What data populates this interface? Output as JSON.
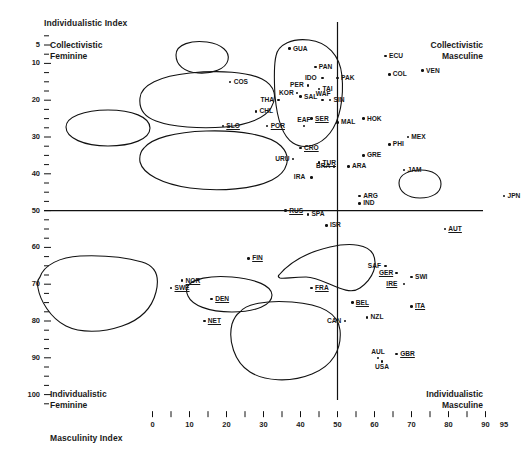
{
  "axes": {
    "y_title": "Individualistic Index",
    "x_title": "Masculinity Index",
    "corner_top_left": "Collectivistic\nFeminine",
    "corner_top_left_l1": "Collectivistic",
    "corner_top_left_l2": "Feminine",
    "corner_top_right_l1": "Collectivistic",
    "corner_top_right_l2": "Masculine",
    "corner_bottom_left_l1": "Individualistic",
    "corner_bottom_left_l2": "Feminine",
    "corner_bottom_right_l1": "Individualistic",
    "corner_bottom_right_l2": "Masculine"
  },
  "chart_data": {
    "type": "scatter",
    "title": "",
    "xlabel": "Masculinity Index",
    "ylabel": "Individualistic Index",
    "xlim": [
      0,
      100
    ],
    "ylim": [
      0,
      100
    ],
    "y_inverted": true,
    "grid": false,
    "legend": "none",
    "xticks": [
      0,
      5,
      10,
      15,
      20,
      25,
      30,
      35,
      40,
      45,
      50,
      55,
      60,
      65,
      70,
      75,
      80,
      85,
      90,
      95
    ],
    "xticklabels": [
      "0",
      "",
      "10",
      "",
      "20",
      "",
      "30",
      "",
      "40",
      "",
      "50",
      "",
      "60",
      "",
      "70",
      "",
      "80",
      "",
      "90",
      "95"
    ],
    "yticks": [
      5,
      10,
      20,
      30,
      40,
      50,
      60,
      70,
      80,
      90,
      100
    ],
    "yticklabels": [
      "5",
      "10",
      "20",
      "30",
      "40",
      "50",
      "60",
      "70",
      "80",
      "90",
      "100"
    ],
    "reference_lines": [
      {
        "axis": "x",
        "value": 50,
        "label": "masculinity-midline"
      },
      {
        "axis": "y",
        "value": 50,
        "label": "individualism-midline"
      }
    ],
    "points": [
      {
        "label": "GUA",
        "x": 37,
        "y": 6,
        "underline": false,
        "lp": "right"
      },
      {
        "label": "PAN",
        "x": 44,
        "y": 11,
        "underline": false,
        "lp": "right"
      },
      {
        "label": "COS",
        "x": 21,
        "y": 15,
        "underline": false,
        "lp": "right"
      },
      {
        "label": "IDO",
        "x": 46,
        "y": 14,
        "underline": false,
        "lp": "left"
      },
      {
        "label": "PAK",
        "x": 50,
        "y": 14,
        "underline": false,
        "lp": "right"
      },
      {
        "label": "PER",
        "x": 42,
        "y": 16,
        "underline": false,
        "lp": "left"
      },
      {
        "label": "TAI",
        "x": 45,
        "y": 17,
        "underline": false,
        "lp": "right"
      },
      {
        "label": "SAL",
        "x": 40,
        "y": 19,
        "underline": false,
        "lp": "right"
      },
      {
        "label": "THA",
        "x": 34,
        "y": 20,
        "underline": false,
        "lp": "left"
      },
      {
        "label": "KOR",
        "x": 39,
        "y": 18,
        "underline": false,
        "lp": "left"
      },
      {
        "label": "SIN",
        "x": 48,
        "y": 20,
        "underline": false,
        "lp": "right"
      },
      {
        "label": "WAF",
        "x": 46,
        "y": 20,
        "underline": false,
        "lp": "above"
      },
      {
        "label": "CHL",
        "x": 28,
        "y": 23,
        "underline": false,
        "lp": "right"
      },
      {
        "label": "EAF",
        "x": 41,
        "y": 27,
        "underline": false,
        "lp": "above"
      },
      {
        "label": "SER",
        "x": 43,
        "y": 25,
        "underline": true,
        "lp": "right"
      },
      {
        "label": "MAL",
        "x": 50,
        "y": 26,
        "underline": false,
        "lp": "right"
      },
      {
        "label": "HOK",
        "x": 57,
        "y": 25,
        "underline": false,
        "lp": "right"
      },
      {
        "label": "SLO",
        "x": 19,
        "y": 27,
        "underline": true,
        "lp": "right"
      },
      {
        "label": "POR",
        "x": 31,
        "y": 27,
        "underline": true,
        "lp": "right"
      },
      {
        "label": "ECU",
        "x": 63,
        "y": 8,
        "underline": false,
        "lp": "right"
      },
      {
        "label": "COL",
        "x": 64,
        "y": 13,
        "underline": false,
        "lp": "right"
      },
      {
        "label": "VEN",
        "x": 73,
        "y": 12,
        "underline": false,
        "lp": "right"
      },
      {
        "label": "MEX",
        "x": 69,
        "y": 30,
        "underline": false,
        "lp": "right"
      },
      {
        "label": "PHI",
        "x": 64,
        "y": 32,
        "underline": false,
        "lp": "right"
      },
      {
        "label": "CRO",
        "x": 40,
        "y": 33,
        "underline": true,
        "lp": "right"
      },
      {
        "label": "URU",
        "x": 38,
        "y": 36,
        "underline": false,
        "lp": "left"
      },
      {
        "label": "TUR",
        "x": 45,
        "y": 37,
        "underline": true,
        "lp": "right"
      },
      {
        "label": "BRA",
        "x": 49,
        "y": 38,
        "underline": false,
        "lp": "left"
      },
      {
        "label": "ARA",
        "x": 53,
        "y": 38,
        "underline": false,
        "lp": "right"
      },
      {
        "label": "GRE",
        "x": 57,
        "y": 35,
        "underline": false,
        "lp": "right"
      },
      {
        "label": "JAM",
        "x": 68,
        "y": 39,
        "underline": false,
        "lp": "right"
      },
      {
        "label": "IRA",
        "x": 43,
        "y": 41,
        "underline": false,
        "lp": "left"
      },
      {
        "label": "ARG",
        "x": 56,
        "y": 46,
        "underline": false,
        "lp": "right"
      },
      {
        "label": "IND",
        "x": 56,
        "y": 48,
        "underline": false,
        "lp": "right"
      },
      {
        "label": "JPN",
        "x": 95,
        "y": 46,
        "underline": false,
        "lp": "right"
      },
      {
        "label": "RUS",
        "x": 36,
        "y": 50,
        "underline": true,
        "lp": "right"
      },
      {
        "label": "SPA",
        "x": 42,
        "y": 51,
        "underline": false,
        "lp": "right"
      },
      {
        "label": "ISR",
        "x": 47,
        "y": 54,
        "underline": false,
        "lp": "right"
      },
      {
        "label": "AUT",
        "x": 79,
        "y": 55,
        "underline": true,
        "lp": "right"
      },
      {
        "label": "SAF",
        "x": 63,
        "y": 65,
        "underline": false,
        "lp": "left"
      },
      {
        "label": "GER",
        "x": 66,
        "y": 67,
        "underline": true,
        "lp": "left"
      },
      {
        "label": "SWI",
        "x": 70,
        "y": 68,
        "underline": false,
        "lp": "right"
      },
      {
        "label": "IRE",
        "x": 68,
        "y": 70,
        "underline": true,
        "lp": "left"
      },
      {
        "label": "FIN",
        "x": 26,
        "y": 63,
        "underline": true,
        "lp": "right"
      },
      {
        "label": "NOR",
        "x": 8,
        "y": 69,
        "underline": true,
        "lp": "right"
      },
      {
        "label": "SWE",
        "x": 5,
        "y": 71,
        "underline": true,
        "lp": "right"
      },
      {
        "label": "DEN",
        "x": 16,
        "y": 74,
        "underline": true,
        "lp": "right"
      },
      {
        "label": "NET",
        "x": 14,
        "y": 80,
        "underline": true,
        "lp": "right"
      },
      {
        "label": "FRA",
        "x": 43,
        "y": 71,
        "underline": true,
        "lp": "right"
      },
      {
        "label": "BEL",
        "x": 54,
        "y": 75,
        "underline": true,
        "lp": "right"
      },
      {
        "label": "ITA",
        "x": 70,
        "y": 76,
        "underline": true,
        "lp": "right"
      },
      {
        "label": "CAN",
        "x": 52,
        "y": 80,
        "underline": false,
        "lp": "left"
      },
      {
        "label": "NZL",
        "x": 58,
        "y": 79,
        "underline": false,
        "lp": "right"
      },
      {
        "label": "AUL",
        "x": 61,
        "y": 90,
        "underline": false,
        "lp": "above"
      },
      {
        "label": "GBR",
        "x": 66,
        "y": 89,
        "underline": true,
        "lp": "right"
      },
      {
        "label": "USA",
        "x": 62,
        "y": 91,
        "underline": false,
        "lp": "below"
      }
    ],
    "clusters": [
      {
        "name": "central-america-cluster",
        "members": [
          "GUA",
          "PAN"
        ]
      },
      {
        "name": "asia-cluster",
        "members": [
          "IDO",
          "PAK",
          "PER",
          "TAI",
          "SAL",
          "THA",
          "KOR",
          "SIN",
          "WAF",
          "EAF",
          "SER",
          "MAL",
          "HOK"
        ]
      },
      {
        "name": "southern-europe-latin-cluster",
        "members": [
          "SLO",
          "POR",
          "CHL"
        ]
      },
      {
        "name": "andean-cluster",
        "members": [
          "ECU",
          "COL",
          "VEN",
          "MEX"
        ]
      },
      {
        "name": "latin-balkan-cluster",
        "members": [
          "CRO",
          "URU",
          "TUR",
          "BRA",
          "ARA",
          "GRE",
          "IRA"
        ]
      },
      {
        "name": "japan-cluster",
        "members": [
          "JPN"
        ]
      },
      {
        "name": "nordic-cluster",
        "members": [
          "FIN",
          "NOR",
          "SWE",
          "DEN",
          "NET"
        ]
      },
      {
        "name": "germanic-cluster",
        "members": [
          "AUT",
          "SAF",
          "GER",
          "SWI",
          "IRE"
        ]
      },
      {
        "name": "french-belgian-cluster",
        "members": [
          "FRA",
          "BEL"
        ]
      },
      {
        "name": "anglo-cluster",
        "members": [
          "CAN",
          "NZL",
          "AUL",
          "GBR",
          "USA"
        ]
      }
    ]
  }
}
